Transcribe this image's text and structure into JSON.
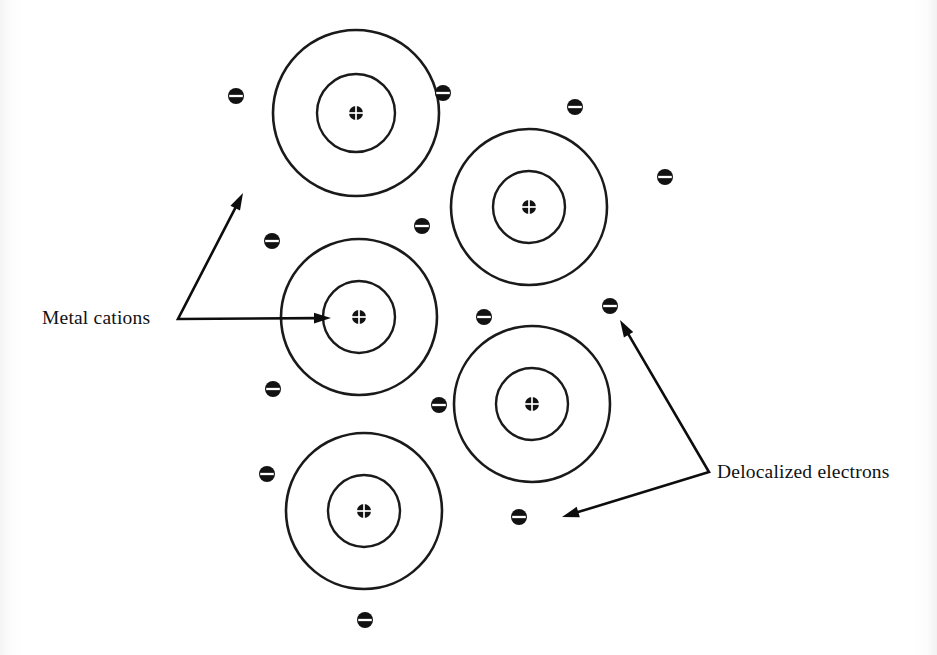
{
  "diagram": {
    "background_color": "#ffffff",
    "ink_color": "#121212",
    "width": 937,
    "height": 655
  },
  "labels": {
    "metal_cations": "Metal cations",
    "delocalized_electrons": "Delocalized electrons"
  },
  "symbols": {
    "cation_nucleus": "circled-plus-icon",
    "electron": "circled-minus-icon"
  },
  "cations": [
    {
      "id": "cation-1",
      "cx": 356,
      "cy": 113,
      "r_outer": 83,
      "r_inner": 39,
      "nucleus_r": 7
    },
    {
      "id": "cation-2",
      "cx": 529,
      "cy": 207,
      "r_outer": 78,
      "r_inner": 36,
      "nucleus_r": 7
    },
    {
      "id": "cation-3",
      "cx": 359,
      "cy": 317,
      "r_outer": 78,
      "r_inner": 36,
      "nucleus_r": 7
    },
    {
      "id": "cation-4",
      "cx": 532,
      "cy": 404,
      "r_outer": 78,
      "r_inner": 36,
      "nucleus_r": 7
    },
    {
      "id": "cation-5",
      "cx": 364,
      "cy": 511,
      "r_outer": 78,
      "r_inner": 36,
      "nucleus_r": 7
    }
  ],
  "electrons": [
    {
      "id": "electron-1",
      "cx": 236,
      "cy": 96,
      "r": 8
    },
    {
      "id": "electron-2",
      "cx": 443,
      "cy": 93,
      "r": 8
    },
    {
      "id": "electron-3",
      "cx": 575,
      "cy": 107,
      "r": 8
    },
    {
      "id": "electron-4",
      "cx": 665,
      "cy": 177,
      "r": 8
    },
    {
      "id": "electron-5",
      "cx": 422,
      "cy": 226,
      "r": 8
    },
    {
      "id": "electron-6",
      "cx": 272,
      "cy": 241,
      "r": 8
    },
    {
      "id": "electron-7",
      "cx": 484,
      "cy": 317,
      "r": 8
    },
    {
      "id": "electron-8",
      "cx": 610,
      "cy": 306,
      "r": 8
    },
    {
      "id": "electron-9",
      "cx": 273,
      "cy": 389,
      "r": 8
    },
    {
      "id": "electron-10",
      "cx": 439,
      "cy": 405,
      "r": 8
    },
    {
      "id": "electron-11",
      "cx": 267,
      "cy": 474,
      "r": 8
    },
    {
      "id": "electron-12",
      "cx": 519,
      "cy": 517,
      "r": 8
    },
    {
      "id": "electron-13",
      "cx": 365,
      "cy": 620,
      "r": 8
    }
  ],
  "leaders": {
    "metal_cations": {
      "vertex": [
        178,
        319
      ],
      "branch_up_tip": [
        243,
        193
      ],
      "branch_right_tip": [
        331,
        318
      ]
    },
    "delocalized_electrons": {
      "vertex": [
        709,
        472
      ],
      "branch_up_tip": [
        620,
        320
      ],
      "branch_down_tip": [
        562,
        517
      ]
    }
  }
}
